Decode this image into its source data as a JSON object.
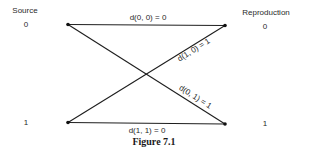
{
  "header": {
    "source_label": "Source",
    "reproduction_label": "Reproduction"
  },
  "source_symbols": [
    "0",
    "1"
  ],
  "reproduction_symbols": [
    "0",
    "1"
  ],
  "edges": [
    {
      "from": "0",
      "to": "0",
      "label": "d(0, 0) = 0"
    },
    {
      "from": "1",
      "to": "0",
      "label": "d(1, 0) = 1"
    },
    {
      "from": "0",
      "to": "1",
      "label": "d(0, 1) = 1"
    },
    {
      "from": "1",
      "to": "1",
      "label": "d(1, 1) = 0"
    }
  ],
  "caption": "Figure 7.1",
  "colors": {
    "line": "#1e1e1e",
    "text": "#2a2a2a",
    "background": "#ffffff"
  }
}
